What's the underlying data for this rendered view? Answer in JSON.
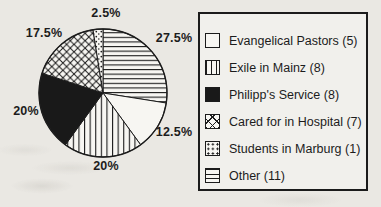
{
  "figure": {
    "background_hex": "#eae8e3",
    "ink_hex": "#1c1c1c",
    "slice_fill_hex": "#f7f6f2"
  },
  "chart_data": {
    "type": "pie",
    "title": "",
    "total": 40,
    "start_angle_deg": 0,
    "direction": "clockwise",
    "legend_position": "right",
    "slices": [
      {
        "name": "Other",
        "count": 11,
        "percent": 27.5,
        "percent_label": "27.5%",
        "pattern": "horizontal-lines"
      },
      {
        "name": "Evangelical Pastors",
        "count": 5,
        "percent": 12.5,
        "percent_label": "12.5%",
        "pattern": "white"
      },
      {
        "name": "Exile in Mainz",
        "count": 8,
        "percent": 20,
        "percent_label": "20%",
        "pattern": "vertical-lines"
      },
      {
        "name": "Philipp's Service",
        "count": 8,
        "percent": 20,
        "percent_label": "20%",
        "pattern": "black"
      },
      {
        "name": "Cared for in Hospital",
        "count": 7,
        "percent": 17.5,
        "percent_label": "17.5%",
        "pattern": "crosshatch"
      },
      {
        "name": "Students in Marburg",
        "count": 1,
        "percent": 2.5,
        "percent_label": "2.5%",
        "pattern": "dots"
      }
    ]
  },
  "legend": {
    "items": [
      {
        "label": "Evangelical Pastors (5)",
        "pattern": "white"
      },
      {
        "label": "Exile in Mainz (8)",
        "pattern": "vertical-lines"
      },
      {
        "label": "Philipp's Service (8)",
        "pattern": "black"
      },
      {
        "label": "Cared for in Hospital (7)",
        "pattern": "crosshatch"
      },
      {
        "label": "Students in Marburg (1)",
        "pattern": "dots"
      },
      {
        "label": "Other (11)",
        "pattern": "horizontal-lines"
      }
    ]
  }
}
